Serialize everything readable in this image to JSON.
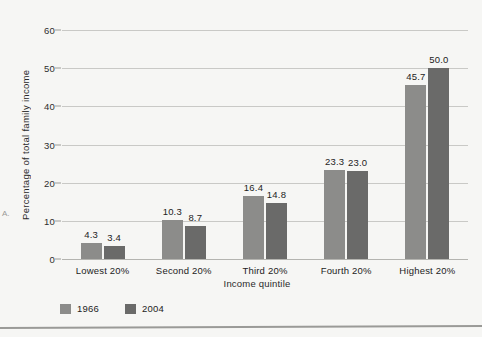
{
  "chart_data": {
    "type": "bar",
    "title": "",
    "xlabel": "Income quintile",
    "ylabel": "Percentage of total family income",
    "categories": [
      "Lowest 20%",
      "Second 20%",
      "Third 20%",
      "Fourth 20%",
      "Highest 20%"
    ],
    "series": [
      {
        "name": "1966",
        "color": "#8c8c8a",
        "values": [
          4.3,
          10.3,
          16.4,
          23.3,
          45.7
        ]
      },
      {
        "name": "2004",
        "color": "#6a6a69",
        "values": [
          3.4,
          8.7,
          14.8,
          23.0,
          50.0
        ]
      }
    ],
    "value_labels": [
      [
        "4.3",
        "3.4"
      ],
      [
        "10.3",
        "8.7"
      ],
      [
        "16.4",
        "14.8"
      ],
      [
        "23.3",
        "23.0"
      ],
      [
        "45.7",
        "50.0"
      ]
    ],
    "ylim": [
      0,
      60
    ],
    "yticks": [
      0,
      10,
      20,
      30,
      40,
      50,
      60
    ],
    "ytick_labels": [
      "0",
      "10",
      "20",
      "30",
      "40",
      "50",
      "60"
    ],
    "grid": true,
    "legend_position": "bottom-left"
  },
  "legend": {
    "items": [
      {
        "label": "1966",
        "color": "#8c8c8a"
      },
      {
        "label": "2004",
        "color": "#6a6a69"
      }
    ]
  },
  "page": {
    "margin_mark": "A."
  }
}
